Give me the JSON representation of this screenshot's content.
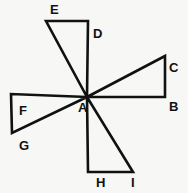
{
  "figure": {
    "background_color": "#f7f7f5",
    "stroke_color": "#111111",
    "stroke_width": 2.6,
    "width": 188,
    "height": 193,
    "center_point": {
      "name": "A",
      "x": 87,
      "y": 97
    },
    "points": {
      "A": {
        "x": 87,
        "y": 97
      },
      "B": {
        "x": 165,
        "y": 97
      },
      "C": {
        "x": 165,
        "y": 56
      },
      "D": {
        "x": 88,
        "y": 21
      },
      "E": {
        "x": 46,
        "y": 21
      },
      "F": {
        "x": 11,
        "y": 94
      },
      "G": {
        "x": 12,
        "y": 133
      },
      "H": {
        "x": 88,
        "y": 172
      },
      "I": {
        "x": 133,
        "y": 172
      }
    },
    "triangles": [
      {
        "name": "upper-triangle-ADE",
        "vertices": [
          "A",
          "D",
          "E"
        ],
        "path": "M 87 97 L 88 21 L 46 21 Z"
      },
      {
        "name": "right-triangle-ABC",
        "vertices": [
          "A",
          "B",
          "C"
        ],
        "path": "M 87 97 L 165 97 L 165 56 Z"
      },
      {
        "name": "left-triangle-AFG",
        "vertices": [
          "A",
          "F",
          "G"
        ],
        "path": "M 87 97 L 11 94 L 12 133 Z"
      },
      {
        "name": "lower-triangle-AHI",
        "vertices": [
          "A",
          "H",
          "I"
        ],
        "path": "M 87 97 L 88 172 L 133 172 Z"
      }
    ],
    "labels": [
      {
        "key": "E",
        "text": "E",
        "x": 50,
        "y": 3,
        "name": "vertex-label-e"
      },
      {
        "key": "D",
        "text": "D",
        "x": 93,
        "y": 27,
        "name": "vertex-label-d"
      },
      {
        "key": "C",
        "text": "C",
        "x": 169,
        "y": 61,
        "name": "vertex-label-c"
      },
      {
        "key": "B",
        "text": "B",
        "x": 169,
        "y": 100,
        "name": "vertex-label-b"
      },
      {
        "key": "A",
        "text": "A",
        "x": 78,
        "y": 101,
        "name": "vertex-label-a"
      },
      {
        "key": "F",
        "text": "F",
        "x": 19,
        "y": 104,
        "name": "vertex-label-f"
      },
      {
        "key": "G",
        "text": "G",
        "x": 19,
        "y": 139,
        "name": "vertex-label-g"
      },
      {
        "key": "H",
        "text": "H",
        "x": 96,
        "y": 176,
        "name": "vertex-label-h"
      },
      {
        "key": "I",
        "text": "I",
        "x": 131,
        "y": 176,
        "name": "vertex-label-i"
      }
    ]
  }
}
